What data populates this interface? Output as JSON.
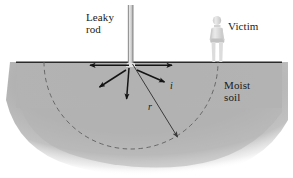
{
  "figure": {
    "background_color": "#ffffff",
    "soil_color": "#b3b3b3",
    "ground_line_color": "#2b2b2b",
    "arrow_color": "#1a1a1a",
    "dashed_circle_color": "#6b6b6b",
    "rod_color": "#d6d6d6",
    "victim_color": "#d9d9d9"
  },
  "labels": {
    "leaky_rod": "Leaky\nrod",
    "leaky_rod_line1": "Leaky",
    "leaky_rod_line2": "rod",
    "victim": "Victim",
    "moist_soil": "Moist\nsoil",
    "moist_soil_line1": "Moist",
    "moist_soil_line2": "soil",
    "current": "i",
    "radius": "r"
  },
  "elements": {
    "rod": {
      "name": "leaky-rod",
      "x": 128,
      "y_top": 5,
      "y_bottom": 63,
      "width": 5
    },
    "victim": {
      "name": "victim-figure",
      "x": 211,
      "y_top": 16,
      "y_bottom": 62
    },
    "ground_line": {
      "x1": 16,
      "y1": 62,
      "x2": 282,
      "y2": 62
    },
    "dashed_semicircle": {
      "center_x": 131,
      "center_y": 62,
      "radius": 87
    },
    "radius_arrow": {
      "from_x": 132,
      "from_y": 64,
      "to_x": 179,
      "to_y": 139
    },
    "current_arrows": [
      {
        "name": "arrow-left",
        "from_x": 129,
        "from_y": 65,
        "to_x": 88,
        "to_y": 65
      },
      {
        "name": "arrow-down-left",
        "from_x": 126,
        "from_y": 70,
        "to_x": 98,
        "to_y": 88
      },
      {
        "name": "arrow-down",
        "from_x": 129,
        "from_y": 68,
        "to_x": 126,
        "to_y": 101
      },
      {
        "name": "arrow-right",
        "from_x": 135,
        "from_y": 65,
        "to_x": 174,
        "to_y": 65
      },
      {
        "name": "arrow-down-right",
        "from_x": 137,
        "from_y": 70,
        "to_x": 166,
        "to_y": 83
      }
    ]
  }
}
